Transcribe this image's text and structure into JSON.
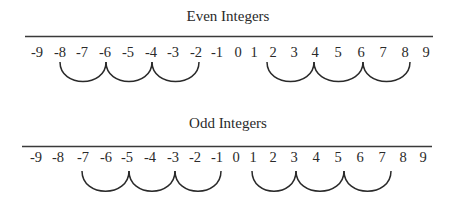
{
  "diagrams": {
    "even": {
      "title": "Even Integers",
      "numbers": [
        "-9",
        "-8",
        "-7",
        "-6",
        "-5",
        "-4",
        "-3",
        "-2",
        "-1",
        "0",
        "1",
        "2",
        "3",
        "4",
        "5",
        "6",
        "7",
        "8",
        "9"
      ],
      "hops_negative": [
        [
          "-8",
          "-6"
        ],
        [
          "-6",
          "-4"
        ],
        [
          "-4",
          "-2"
        ]
      ],
      "hops_positive": [
        [
          "2",
          "4"
        ],
        [
          "4",
          "6"
        ],
        [
          "6",
          "8"
        ]
      ]
    },
    "odd": {
      "title": "Odd Integers",
      "numbers": [
        "-9",
        "-8",
        "-7",
        "-6",
        "-5",
        "-4",
        "-3",
        "-2",
        "-1",
        "0",
        "1",
        "2",
        "3",
        "4",
        "5",
        "6",
        "7",
        "8",
        "9"
      ],
      "hops_negative": [
        [
          "-7",
          "-5"
        ],
        [
          "-5",
          "-3"
        ],
        [
          "-3",
          "-1"
        ]
      ],
      "hops_positive": [
        [
          "1",
          "3"
        ],
        [
          "3",
          "5"
        ],
        [
          "5",
          "7"
        ]
      ]
    }
  },
  "colors": {
    "ink": "#2a2a2a",
    "line": "#3a3a3a",
    "background": "#ffffff"
  }
}
